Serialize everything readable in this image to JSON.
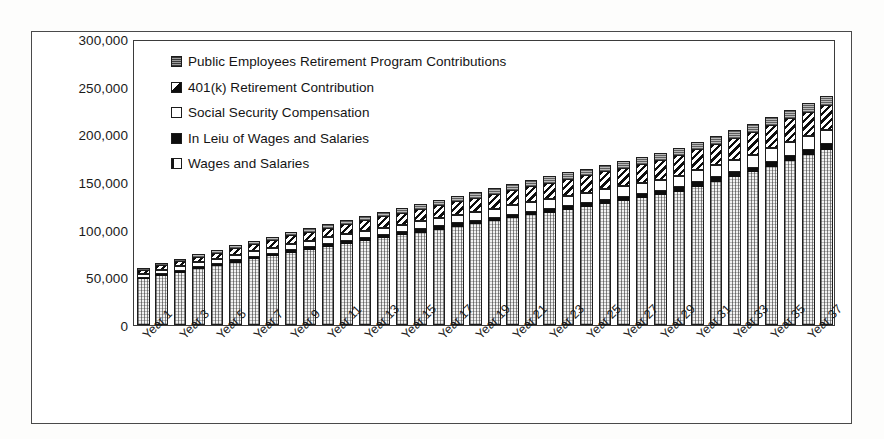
{
  "chart_data": {
    "type": "bar",
    "subtype": "stacked-column",
    "title": "",
    "xlabel": "",
    "ylabel": "",
    "ylim": [
      0,
      300000
    ],
    "ytick_values": [
      0,
      50000,
      100000,
      150000,
      200000,
      250000,
      300000
    ],
    "ytick_labels": [
      "0",
      "50,000",
      "100,000",
      "150,000",
      "200,000",
      "250,000",
      "300,000"
    ],
    "grid": false,
    "legend_position": "inside-top-left",
    "xtick_rotation": -45,
    "xtick_label_interval": 2,
    "categories": [
      "Year 1",
      "Year 2",
      "Year 3",
      "Year 4",
      "Year 5",
      "Year 6",
      "Year 7",
      "Year 8",
      "Year 9",
      "Year 10",
      "Year 11",
      "Year 12",
      "Year 13",
      "Year 14",
      "Year 15",
      "Year 16",
      "Year 17",
      "Year 18",
      "Year 19",
      "Year 20",
      "Year 21",
      "Year 22",
      "Year 23",
      "Year 24",
      "Year 25",
      "Year 26",
      "Year 27",
      "Year 28",
      "Year 29",
      "Year 30",
      "Year 31",
      "Year 32",
      "Year 33",
      "Year 34",
      "Year 35",
      "Year 36",
      "Year 37",
      "Year 38"
    ],
    "visible_xtick_labels": [
      "Year 1",
      "Year 3",
      "Year 5",
      "Year 7",
      "Year 9",
      "Year 11",
      "Year 13",
      "Year 15",
      "Year 17",
      "Year 19",
      "Year 21",
      "Year 23",
      "Year 25",
      "Year 27",
      "Year 29",
      "Year 31",
      "Year 33",
      "Year 35",
      "Year 37"
    ],
    "series": [
      {
        "name": "Wages and Salaries",
        "pattern": "light-crosshatch",
        "stack_order": 0,
        "values": [
          48000,
          51500,
          55000,
          58500,
          62000,
          65500,
          69000,
          72000,
          76000,
          79000,
          82000,
          85000,
          88000,
          91000,
          94000,
          97000,
          100000,
          103000,
          106000,
          109000,
          112000,
          115000,
          118000,
          121000,
          124000,
          127000,
          130000,
          133000,
          136000,
          140000,
          145000,
          150000,
          155000,
          160000,
          166000,
          172000,
          178000,
          184000
        ]
      },
      {
        "name": "In Leiu of Wages and Salaries",
        "pattern": "solid-black",
        "stack_order": 1,
        "values": [
          1800,
          1900,
          2000,
          2100,
          2200,
          2300,
          2400,
          2500,
          2600,
          2700,
          2800,
          2900,
          3000,
          3100,
          3200,
          3300,
          3400,
          3500,
          3600,
          3700,
          3800,
          3900,
          4000,
          4100,
          4200,
          4300,
          4400,
          4500,
          4600,
          4700,
          4800,
          4900,
          5000,
          5100,
          5200,
          5300,
          5400,
          5500
        ]
      },
      {
        "name": "Social Security Compensation",
        "pattern": "white",
        "stack_order": 2,
        "values": [
          4200,
          4500,
          4800,
          5100,
          5400,
          5700,
          6000,
          6300,
          6600,
          6900,
          7100,
          7400,
          7700,
          8000,
          8200,
          8500,
          8700,
          9000,
          9200,
          9500,
          9700,
          10000,
          10200,
          10500,
          10700,
          11000,
          11200,
          11500,
          11700,
          12000,
          12400,
          12800,
          13200,
          13600,
          14000,
          14400,
          14800,
          15200
        ]
      },
      {
        "name": "401(k) Retirement Contribution",
        "pattern": "diagonal-stripe",
        "stack_order": 3,
        "values": [
          4000,
          4600,
          5200,
          5800,
          6400,
          7000,
          7600,
          8200,
          8800,
          9400,
          10000,
          10600,
          11200,
          11800,
          12400,
          13000,
          13600,
          14200,
          14800,
          15400,
          16000,
          16600,
          17200,
          17800,
          18400,
          19000,
          19600,
          20200,
          20800,
          21400,
          22000,
          22600,
          23200,
          23800,
          24400,
          25000,
          25600,
          26200
        ]
      },
      {
        "name": "Public Employees Retirement Program Contributions",
        "pattern": "gray-dotted",
        "stack_order": 4,
        "values": [
          2000,
          2200,
          2400,
          2600,
          2800,
          3000,
          3200,
          3400,
          3600,
          3800,
          4000,
          4200,
          4400,
          4600,
          4800,
          5000,
          5200,
          5400,
          5600,
          5800,
          6000,
          6200,
          6400,
          6600,
          6800,
          7000,
          7200,
          7400,
          7600,
          7800,
          8000,
          8200,
          8400,
          8600,
          8800,
          9000,
          9200,
          9400
        ]
      }
    ],
    "totals": [
      60000,
      64700,
      69400,
      74100,
      78800,
      83500,
      88200,
      92400,
      97600,
      101800,
      105900,
      110100,
      114300,
      118500,
      122600,
      126800,
      130900,
      135100,
      139200,
      143400,
      147500,
      151700,
      155800,
      160000,
      164100,
      168300,
      172400,
      176600,
      180700,
      185900,
      192200,
      198500,
      204800,
      211100,
      218400,
      225700,
      233000,
      240300
    ]
  },
  "legend": {
    "items": [
      {
        "label": "Public Employees Retirement Program Contributions",
        "key": "perp"
      },
      {
        "label": "401(k) Retirement Contribution",
        "key": "401k"
      },
      {
        "label": "Social Security Compensation",
        "key": "ssc"
      },
      {
        "label": "In Leiu of Wages and Salaries",
        "key": "inlieu"
      },
      {
        "label": "Wages and Salaries",
        "key": "wages"
      }
    ]
  },
  "colors": {
    "axis": "#3b3b3b",
    "frame": "#4a4a4a",
    "text": "#1a1a1a",
    "bar_outline": "#1d1d1d",
    "solid_black": "#0d0d0d",
    "white_fill": "#ffffff",
    "gray_fill": "#b9b9b9",
    "page_background": "#fdfdfc"
  }
}
